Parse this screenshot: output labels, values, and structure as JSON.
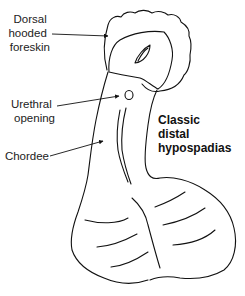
{
  "diagram": {
    "title_lines": [
      "Classic",
      "distal",
      "hypospadias"
    ],
    "labels": [
      {
        "id": "foreskin",
        "lines": [
          "Dorsal",
          "hooded",
          "foreskin"
        ]
      },
      {
        "id": "urethral",
        "lines": [
          "Urethral",
          "opening"
        ]
      },
      {
        "id": "chordee",
        "lines": [
          "Chordee"
        ]
      }
    ],
    "colors": {
      "stroke": "#111111",
      "text": "#222222",
      "background": "#ffffff"
    }
  }
}
